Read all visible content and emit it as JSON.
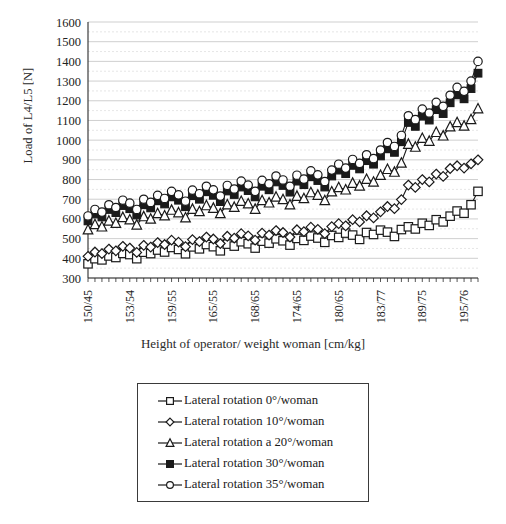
{
  "chart_data": {
    "type": "line",
    "title": "",
    "xlabel": "Height of operator/ weight woman [cm/kg]",
    "ylabel": "Load of L4/L5 [N]",
    "ylim": [
      300,
      1600
    ],
    "ytick_step": 100,
    "yminor_step": 50,
    "grid": true,
    "legend_position": "below",
    "ytick_labels": [
      "1600",
      "1500",
      "1400",
      "1300",
      "1200",
      "1100",
      "1000",
      "900",
      "800",
      "700",
      "600",
      "500",
      "400",
      "300"
    ],
    "xtick_labels": [
      "150/45",
      "153/54",
      "159/55",
      "165/55",
      "168/65",
      "174/65",
      "180/65",
      "183/77",
      "189/75",
      "195/76"
    ],
    "n_points": 57,
    "series": [
      {
        "name": "Lateral rotation 0°/woman",
        "marker": "open-square",
        "values": [
          372,
          398,
          392,
          412,
          404,
          425,
          419,
          398,
          431,
          424,
          442,
          432,
          455,
          445,
          423,
          458,
          448,
          470,
          459,
          438,
          472,
          462,
          484,
          474,
          452,
          487,
          477,
          499,
          489,
          467,
          501,
          491,
          513,
          503,
          481,
          516,
          506,
          528,
          518,
          496,
          531,
          521,
          543,
          533,
          511,
          546,
          560,
          549,
          578,
          567,
          596,
          585,
          614,
          640,
          629,
          672,
          740
        ]
      },
      {
        "name": "Lateral rotation 10°/woman",
        "marker": "open-diamond",
        "values": [
          410,
          432,
          424,
          447,
          438,
          461,
          452,
          430,
          466,
          457,
          480,
          470,
          492,
          482,
          459,
          495,
          485,
          508,
          498,
          475,
          512,
          502,
          525,
          514,
          492,
          528,
          518,
          541,
          531,
          508,
          545,
          535,
          558,
          547,
          525,
          561,
          576,
          565,
          596,
          585,
          616,
          605,
          636,
          663,
          652,
          698,
          772,
          760,
          800,
          788,
          828,
          816,
          856,
          870,
          858,
          880,
          900
        ]
      },
      {
        "name": "Lateral rotation a 20°/woman",
        "marker": "open-triangle",
        "values": [
          545,
          572,
          560,
          590,
          578,
          608,
          596,
          570,
          612,
          600,
          628,
          616,
          645,
          632,
          606,
          650,
          638,
          668,
          655,
          628,
          672,
          660,
          690,
          677,
          650,
          694,
          682,
          712,
          699,
          672,
          716,
          704,
          734,
          721,
          694,
          738,
          760,
          748,
          782,
          768,
          802,
          788,
          822,
          852,
          838,
          884,
          980,
          965,
          1010,
          995,
          1040,
          1022,
          1068,
          1090,
          1072,
          1105,
          1160
        ]
      },
      {
        "name": "Lateral rotation 30°/woman",
        "marker": "filled-square",
        "values": [
          590,
          625,
          610,
          648,
          632,
          668,
          652,
          620,
          672,
          656,
          692,
          676,
          712,
          695,
          662,
          718,
          700,
          738,
          720,
          688,
          742,
          724,
          762,
          744,
          712,
          766,
          748,
          788,
          770,
          736,
          792,
          774,
          814,
          795,
          762,
          818,
          848,
          830,
          872,
          854,
          896,
          878,
          920,
          956,
          938,
          992,
          1090,
          1070,
          1122,
          1102,
          1155,
          1135,
          1190,
          1230,
          1210,
          1262,
          1340
        ]
      },
      {
        "name": "Lateral rotation 35°/woman",
        "marker": "open-circle",
        "values": [
          615,
          648,
          635,
          672,
          658,
          695,
          680,
          648,
          700,
          684,
          720,
          704,
          740,
          722,
          690,
          746,
          728,
          766,
          748,
          716,
          770,
          752,
          792,
          772,
          740,
          796,
          778,
          818,
          798,
          766,
          822,
          802,
          844,
          824,
          790,
          848,
          878,
          858,
          902,
          882,
          926,
          906,
          950,
          988,
          968,
          1024,
          1124,
          1104,
          1158,
          1138,
          1192,
          1172,
          1228,
          1268,
          1248,
          1300,
          1400
        ]
      }
    ]
  },
  "legend": {
    "items": [
      {
        "label": "Lateral rotation 0°/woman",
        "marker": "open-square"
      },
      {
        "label": "Lateral rotation 10°/woman",
        "marker": "open-diamond"
      },
      {
        "label": "Lateral rotation a 20°/woman",
        "marker": "open-triangle"
      },
      {
        "label": "Lateral rotation 30°/woman",
        "marker": "filled-square"
      },
      {
        "label": "Lateral rotation 35°/woman",
        "marker": "open-circle"
      }
    ]
  },
  "colors": {
    "line": "#1a1a1a",
    "grid_major": "#c9c9c9",
    "grid_minor": "#e0e0e0",
    "axis": "#2b2b2b",
    "background": "#ffffff"
  }
}
